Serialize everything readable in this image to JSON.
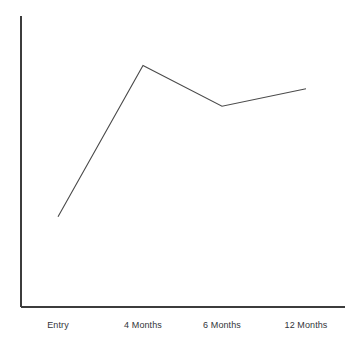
{
  "chart_data": {
    "type": "line",
    "title": "",
    "subtitle": "",
    "xlabel": "",
    "ylabel": "",
    "categories": [
      "Entry",
      "4 Months",
      "6 Months",
      "12 Months"
    ],
    "series": [
      {
        "name": "",
        "values": [
          0.31,
          0.83,
          0.69,
          0.75
        ]
      }
    ],
    "values": [
      0.31,
      0.83,
      0.69,
      0.75
    ],
    "ylim": [
      0,
      1
    ],
    "xlim": [
      0,
      3
    ],
    "grid": false,
    "legend": false,
    "legend_position": "none",
    "markers": false,
    "y_tick_labels": [],
    "x_tick_labels": [
      "Entry",
      "4 Months",
      "6 Months",
      "12 Months"
    ],
    "annotations": [],
    "colors": {
      "line": "#4a4a4a",
      "axis": "#3c3c3c",
      "background": "#ffffff",
      "text": "#33353a"
    }
  },
  "axes": {
    "y_axis_name": "y-axis",
    "x_axis_name": "x-axis"
  }
}
